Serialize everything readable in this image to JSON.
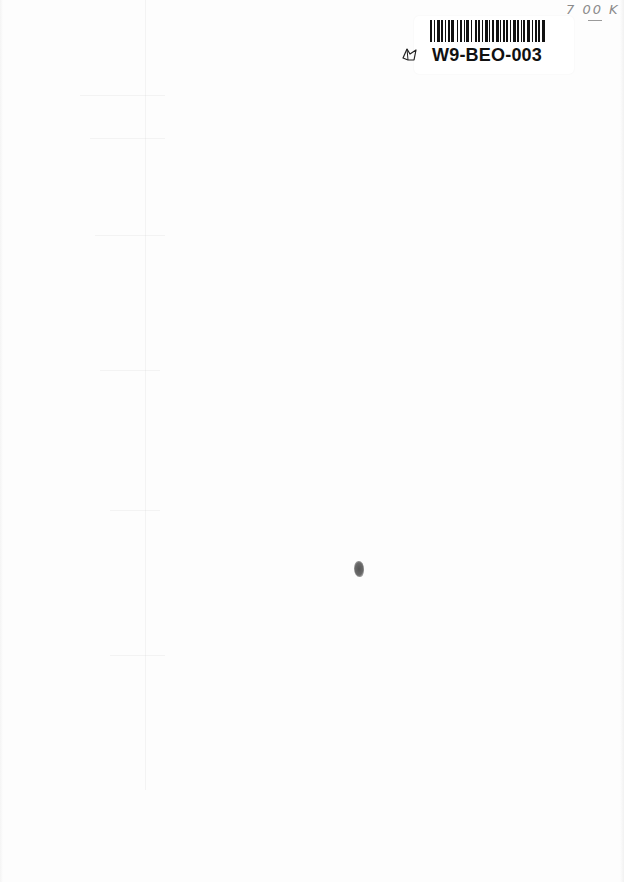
{
  "document": {
    "type": "scanned-blank-page",
    "background_color": "#fdfdfd"
  },
  "sticker": {
    "barcode_label": "W9-BEO-003",
    "icon": "book-icon",
    "bar_color": "#111111"
  },
  "handwritten_note": {
    "text": "7 00 K"
  },
  "marks": {
    "speck": "ink-speck"
  }
}
